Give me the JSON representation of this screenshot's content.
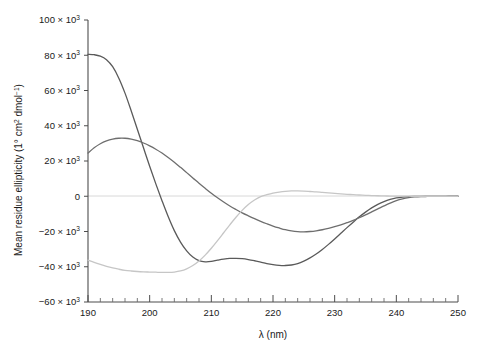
{
  "figure": {
    "background": "#ffffff",
    "width": 483,
    "height": 349
  },
  "chart_data": {
    "type": "line",
    "title": "",
    "subtitle": "",
    "xlabel": "λ (nm)",
    "ylabel": "Mean residue ellipticity (1° cm² dmol⁻¹)",
    "ylabel_parts": {
      "main": "Mean residue ellipticity (1° cm",
      "sup1": "2",
      "mid": " dmol",
      "sup2": "−1",
      "tail": ")"
    },
    "xlim": [
      190,
      250
    ],
    "ylim": [
      -60000,
      100000
    ],
    "x_tick_step_major": 10,
    "x_tick_step_minor": 2,
    "y_tick_step_major": 20000,
    "grid": false,
    "zero_line": true,
    "legend": null,
    "legend_position": "none",
    "x_tick_labels": [
      "190",
      "200",
      "210",
      "220",
      "230",
      "240",
      "250"
    ],
    "x_tick_values": [
      190,
      200,
      210,
      220,
      230,
      240,
      250
    ],
    "y_tick_values": [
      100000,
      80000,
      60000,
      40000,
      20000,
      0,
      -20000,
      -40000,
      -60000
    ],
    "y_tick_labels": [
      {
        "mantissa": "100 × 10",
        "exp": "3"
      },
      {
        "mantissa": "80 × 10",
        "exp": "3"
      },
      {
        "mantissa": "60 × 10",
        "exp": "3"
      },
      {
        "mantissa": "40 × 10",
        "exp": "3"
      },
      {
        "mantissa": "20 × 10",
        "exp": "3"
      },
      {
        "mantissa": "0",
        "exp": ""
      },
      {
        "mantissa": "−20 × 10",
        "exp": "3"
      },
      {
        "mantissa": "−40 × 10",
        "exp": "3"
      },
      {
        "mantissa": "−60 × 10",
        "exp": "3"
      }
    ],
    "x": [
      190,
      191,
      192,
      193,
      194,
      195,
      196,
      197,
      198,
      199,
      200,
      201,
      202,
      203,
      204,
      205,
      206,
      207,
      208,
      209,
      210,
      211,
      212,
      213,
      214,
      215,
      216,
      217,
      218,
      219,
      220,
      221,
      222,
      223,
      224,
      225,
      226,
      227,
      228,
      229,
      230,
      231,
      232,
      233,
      234,
      235,
      236,
      237,
      238,
      239,
      240,
      241,
      242,
      243,
      244,
      245,
      246,
      247,
      248,
      249,
      250
    ],
    "series": [
      {
        "name": "curve-alpha-helix",
        "color": "#5a5a5a",
        "values": [
          80500,
          80300,
          79500,
          77500,
          73500,
          67000,
          58500,
          48500,
          38000,
          27500,
          17000,
          7000,
          -2500,
          -11500,
          -19500,
          -26000,
          -31000,
          -34500,
          -36500,
          -37200,
          -37000,
          -36300,
          -35700,
          -35300,
          -35200,
          -35400,
          -35900,
          -36600,
          -37400,
          -38200,
          -38800,
          -39200,
          -39300,
          -39000,
          -38200,
          -36800,
          -35000,
          -32800,
          -30200,
          -27300,
          -24200,
          -21000,
          -17800,
          -14700,
          -11700,
          -9000,
          -6600,
          -4600,
          -3000,
          -1800,
          -950,
          -450,
          -200,
          -100,
          -60,
          -40,
          -30,
          -20,
          -15,
          -10,
          -8
        ]
      },
      {
        "name": "curve-mixed",
        "color": "#6e6e6e",
        "values": [
          24500,
          27500,
          29800,
          31400,
          32400,
          32900,
          32900,
          32400,
          31500,
          30200,
          28600,
          26700,
          24500,
          22000,
          19300,
          16400,
          13400,
          10400,
          7400,
          4500,
          1700,
          -900,
          -3300,
          -5500,
          -7500,
          -9400,
          -11100,
          -12700,
          -14200,
          -15600,
          -16900,
          -18000,
          -19000,
          -19700,
          -20100,
          -20200,
          -20000,
          -19600,
          -19000,
          -18200,
          -17300,
          -16200,
          -15000,
          -13700,
          -12200,
          -10600,
          -8900,
          -7200,
          -5500,
          -3900,
          -2500,
          -1500,
          -800,
          -400,
          -200,
          -120,
          -80,
          -50,
          -30,
          -20,
          -12
        ]
      },
      {
        "name": "curve-beta-sheet",
        "color": "#c6c6c6",
        "values": [
          -36200,
          -37500,
          -38700,
          -39800,
          -40700,
          -41400,
          -42000,
          -42400,
          -42700,
          -42900,
          -43000,
          -43100,
          -43200,
          -43200,
          -43000,
          -42400,
          -41200,
          -39300,
          -36700,
          -33400,
          -29500,
          -25200,
          -20700,
          -16200,
          -11900,
          -8000,
          -4700,
          -2100,
          -200,
          900,
          1800,
          2400,
          2800,
          3000,
          3000,
          2900,
          2700,
          2500,
          2200,
          1900,
          1600,
          1350,
          1100,
          900,
          700,
          550,
          400,
          280,
          180,
          110,
          60,
          30,
          15,
          8,
          5,
          3,
          2,
          2,
          1,
          1,
          0
        ]
      }
    ],
    "annotations": []
  }
}
